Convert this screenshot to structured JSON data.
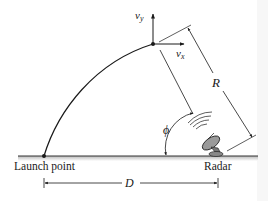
{
  "diagram": {
    "labels": {
      "launch_point": "Launch point",
      "radar": "Radar",
      "distance": "D",
      "range": "R",
      "angle": "ϕ",
      "vx_symbol": "v",
      "vx_sub": "x",
      "vy_symbol": "v",
      "vy_sub": "y"
    },
    "colors": {
      "line": "#1a1a1a",
      "ground": "#333333",
      "ground_shadow": "#c8c8c8",
      "dish_fill": "#9a9a9a"
    }
  }
}
